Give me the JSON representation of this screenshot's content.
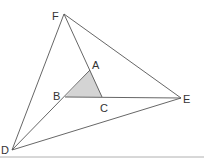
{
  "diagram": {
    "title": "",
    "colors": {
      "line": "#555555",
      "shade": "#d4d4d4",
      "label": "#333333",
      "bottom_rule": "#b0b0b0"
    },
    "points": {
      "F": {
        "label": "F",
        "x": 64,
        "y": 14
      },
      "A": {
        "label": "A",
        "x": 90,
        "y": 70
      },
      "B": {
        "label": "B",
        "x": 65,
        "y": 97
      },
      "C": {
        "label": "C",
        "x": 102,
        "y": 97
      },
      "E": {
        "label": "E",
        "x": 181,
        "y": 98
      },
      "D": {
        "label": "D",
        "x": 12,
        "y": 150
      }
    },
    "shaded_triangle": [
      "A",
      "B",
      "C"
    ],
    "segments": [
      [
        "F",
        "E"
      ],
      [
        "F",
        "D"
      ],
      [
        "D",
        "E"
      ],
      [
        "F",
        "C"
      ],
      [
        "D",
        "A"
      ],
      [
        "B",
        "E"
      ]
    ]
  }
}
